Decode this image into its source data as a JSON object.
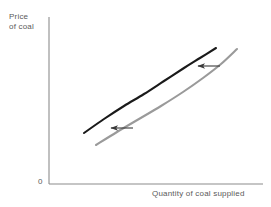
{
  "chart_data": {
    "type": "line",
    "title": "",
    "subtitle": "",
    "xlabel": "Quantity of coal supplied",
    "ylabel_line1": "Price",
    "ylabel_line2": "of coal",
    "ylabel": "Price of coal",
    "origin_label": "0",
    "grid": false,
    "legend": "none",
    "axis": {
      "x_start_px": 49,
      "x_end_px": 263,
      "y_top_px": 17,
      "y_bottom_px": 184,
      "color": "#8c8c8c",
      "ticks": [],
      "tick_labels": []
    },
    "xlim": [
      0,
      1
    ],
    "ylim": [
      0,
      1
    ],
    "series": [
      {
        "name": "supply-curve-original",
        "role": "original supply curve",
        "color": "#1a1a1a",
        "width": 2.1,
        "points": [
          [
            84,
            133
          ],
          [
            104,
            119
          ],
          [
            124,
            106
          ],
          [
            144,
            94
          ],
          [
            164,
            81
          ],
          [
            184,
            68
          ],
          [
            200,
            58
          ],
          [
            216,
            48
          ]
        ]
      },
      {
        "name": "supply-curve-shifted",
        "role": "shifted supply curve",
        "color": "#9a9a9a",
        "width": 2.1,
        "points": [
          [
            96,
            145
          ],
          [
            117,
            132
          ],
          [
            139,
            119
          ],
          [
            161,
            106
          ],
          [
            183,
            92
          ],
          [
            203,
            78
          ],
          [
            221,
            64
          ],
          [
            237,
            49
          ]
        ]
      }
    ],
    "annotations": [
      {
        "name": "shift-arrow-upper",
        "type": "arrow",
        "direction": "left",
        "label": "",
        "color": "#3a3a3a",
        "x1": 220,
        "y1": 66,
        "x2": 198,
        "y2": 66
      },
      {
        "name": "shift-arrow-lower",
        "type": "arrow",
        "direction": "left",
        "label": "",
        "color": "#3a3a3a",
        "x1": 133,
        "y1": 128,
        "x2": 111,
        "y2": 128
      }
    ]
  }
}
